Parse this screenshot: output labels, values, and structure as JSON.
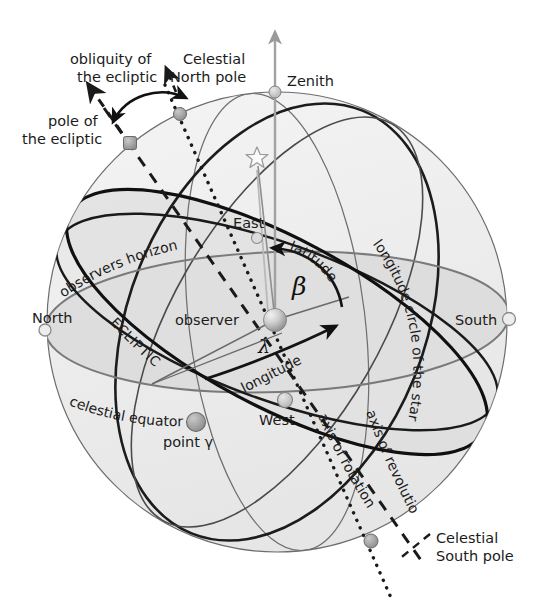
{
  "figure": {
    "background_color": "#ffffff"
  },
  "colors": {
    "sphere_fill": "#efefef",
    "sphere_fill_dark": "#e2e2e2",
    "horizon_plane": "#dedede",
    "outline": "#5a5a5a",
    "ecliptic": "#1a1a1a",
    "equator": "#1a1a1a",
    "horizon_line": "#6f6f6f",
    "node_light": "#d5d5d5",
    "node_dark": "#9a9a9a",
    "zenith_arrow": "#9a9a9a",
    "text": "#1b1b1b"
  },
  "labels": {
    "obliquity": {
      "line1": "obliquity of",
      "line2": "the ecliptic"
    },
    "celestial_north_pole": {
      "line1": "Celestial",
      "line2": "North pole"
    },
    "pole_of_ecliptic": {
      "line1": "pole of",
      "line2": "the ecliptic"
    },
    "celestial_south_pole": {
      "line1": "Celestial",
      "line2": "South pole"
    },
    "zenith": "Zenith",
    "east": "East",
    "west": "West",
    "north": "North",
    "south": "South",
    "observer": "observer",
    "observers_horizon": "observers horizon",
    "ecliptic": "ECLIPTIC",
    "celestial_equator": "celestial  equator",
    "point_gamma": "point γ",
    "latitude": "latitude",
    "longitude": "longitude",
    "longitude_circle": "longitude circle of the star",
    "axis_of_revolution": "axis of revolutio Ω",
    "axis_of_rotation": "axis of rotation",
    "beta_symbol": "β",
    "lambda_symbol": "λ"
  },
  "markers": {
    "zenith": {
      "x": 275,
      "y": 92,
      "r": 6,
      "style": "light"
    },
    "celestial_north_pole": {
      "x": 180,
      "y": 114,
      "r": 6.5,
      "style": "dark"
    },
    "pole_of_the_ecliptic": {
      "x": 130,
      "y": 143,
      "r": 6.5,
      "style": "square"
    },
    "north": {
      "x": 45,
      "y": 330,
      "r": 6,
      "style": "light"
    },
    "south": {
      "x": 509,
      "y": 319,
      "r": 6,
      "style": "light"
    },
    "east": {
      "x": 257,
      "y": 238,
      "r": 5.5,
      "style": "light"
    },
    "west": {
      "x": 285,
      "y": 400,
      "r": 7,
      "style": "light"
    },
    "point_gamma": {
      "x": 196,
      "y": 422,
      "r": 9,
      "style": "dark"
    },
    "celestial_south_pole": {
      "x": 371,
      "y": 541,
      "r": 7,
      "style": "dark"
    },
    "observer": {
      "x": 275,
      "y": 320,
      "r": 11.5,
      "style": "sphere"
    },
    "star": {
      "x": 257,
      "y": 158,
      "r": 10,
      "style": "star-outline"
    }
  },
  "geometry": {
    "sphere": {
      "cx": 277,
      "cy": 322,
      "r": 230
    },
    "horizon_tilt_deg": -2,
    "ecliptic_tilt_deg": 28,
    "equator_tilt_deg": 20
  }
}
